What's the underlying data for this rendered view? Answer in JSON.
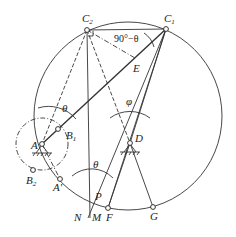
{
  "diagram": {
    "type": "mechanism-geometry",
    "points": {
      "A": {
        "label": "A",
        "x": 42,
        "y": 144
      },
      "B1": {
        "label": "B",
        "sub": "1",
        "x": 58,
        "y": 129
      },
      "B2": {
        "label": "B",
        "sub": "2",
        "x": 33,
        "y": 170
      },
      "A_prime": {
        "label": "A'",
        "x": 60,
        "y": 179
      },
      "C1": {
        "label": "C",
        "sub": "1",
        "x": 166,
        "y": 29
      },
      "C2": {
        "label": "C",
        "sub": "2",
        "x": 87,
        "y": 30
      },
      "D": {
        "label": "D",
        "x": 130,
        "y": 143
      },
      "E": {
        "label": "E",
        "x": 135,
        "y": 60
      },
      "F": {
        "label": "F",
        "x": 108,
        "y": 208
      },
      "G": {
        "label": "G",
        "x": 153,
        "y": 207
      },
      "P": {
        "label": "P",
        "x": 92,
        "y": 199
      },
      "M": {
        "label": "M"
      },
      "N": {
        "label": "N"
      }
    },
    "angles": {
      "theta_top": "θ",
      "theta_bottom": "θ",
      "phi": "φ",
      "complement": "90°−θ"
    },
    "circles": {
      "big": {
        "cx": 128,
        "cy": 116,
        "r": 94
      },
      "crank": {
        "cx": 42,
        "cy": 144,
        "r": 26
      }
    },
    "line_color": "#333333"
  }
}
